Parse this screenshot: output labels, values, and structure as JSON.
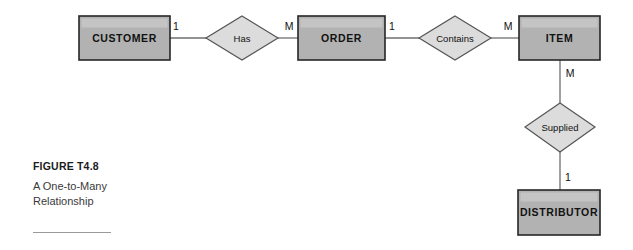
{
  "figure": {
    "label_keyword": "FIGURE",
    "number": "T4.8",
    "description_line1": "A One-to-Many",
    "description_line2": "Relationship"
  },
  "colors": {
    "entity_fill": "#b2b2b2",
    "entity_stroke": "#262626",
    "relationship_fill": "#dcdcdc",
    "relationship_stroke": "#555555",
    "connector": "#6e6e6e",
    "background": "#ffffff",
    "text": "#111111"
  },
  "diagram": {
    "type": "entity-relationship",
    "entities": [
      {
        "id": "customer",
        "label": "CUSTOMER",
        "x": 79,
        "y": 16,
        "w": 91,
        "h": 44
      },
      {
        "id": "order",
        "label": "ORDER",
        "x": 298,
        "y": 16,
        "w": 87,
        "h": 44
      },
      {
        "id": "item",
        "label": "ITEM",
        "x": 519,
        "y": 16,
        "w": 81,
        "h": 44
      },
      {
        "id": "distributor",
        "label": "DISTRIBUTOR",
        "x": 518,
        "y": 190,
        "w": 82,
        "h": 45
      }
    ],
    "relationships": [
      {
        "id": "has",
        "label": "Has",
        "cx": 242,
        "cy": 38,
        "rx": 36,
        "ry": 22
      },
      {
        "id": "contains",
        "label": "Contains",
        "cx": 455,
        "cy": 38,
        "rx": 36,
        "ry": 22
      },
      {
        "id": "supplied",
        "label": "Supplied",
        "cx": 560,
        "cy": 127,
        "rx": 35,
        "ry": 25
      }
    ],
    "connections": [
      {
        "from": "customer",
        "to": "has",
        "cardinality": "1",
        "label_x": 176,
        "label_y": 27
      },
      {
        "from": "has",
        "to": "order",
        "cardinality": "M",
        "label_x": 289,
        "label_y": 27
      },
      {
        "from": "order",
        "to": "contains",
        "cardinality": "1",
        "label_x": 392,
        "label_y": 27
      },
      {
        "from": "contains",
        "to": "item",
        "cardinality": "M",
        "label_x": 508,
        "label_y": 27
      },
      {
        "from": "item",
        "to": "supplied",
        "cardinality": "M",
        "label_x": 570,
        "label_y": 74
      },
      {
        "from": "supplied",
        "to": "distributor",
        "cardinality": "1",
        "label_x": 568,
        "label_y": 178
      }
    ]
  }
}
